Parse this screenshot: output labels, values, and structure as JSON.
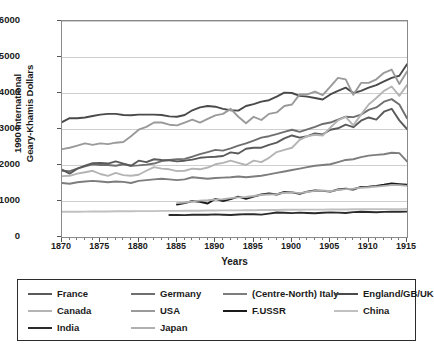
{
  "chart_data": {
    "type": "line",
    "title": "",
    "xlabel": "Years",
    "ylabel_line1": "1990 International",
    "ylabel_line2": "Geary-Khamis Dollars",
    "xlim": [
      1870,
      1915
    ],
    "ylim": [
      0,
      6000
    ],
    "xticks": [
      1870,
      1875,
      1880,
      1885,
      1890,
      1895,
      1900,
      1905,
      1910,
      1915
    ],
    "yticks": [
      0,
      1000,
      2000,
      3000,
      4000,
      5000,
      6000
    ],
    "grid": "horizontal",
    "legend_position": "below-plot",
    "x": [
      1870,
      1871,
      1872,
      1873,
      1874,
      1875,
      1876,
      1877,
      1878,
      1879,
      1880,
      1881,
      1882,
      1883,
      1884,
      1885,
      1886,
      1887,
      1888,
      1889,
      1890,
      1891,
      1892,
      1893,
      1894,
      1895,
      1896,
      1897,
      1898,
      1899,
      1900,
      1901,
      1902,
      1903,
      1904,
      1905,
      1906,
      1907,
      1908,
      1909,
      1910,
      1911,
      1912,
      1913,
      1914,
      1915
    ],
    "series": [
      {
        "name": "England/GB/UK",
        "color": "#4a4a4a",
        "width": 1.9,
        "start_year": 1870,
        "values": [
          3190,
          3300,
          3300,
          3320,
          3360,
          3400,
          3420,
          3420,
          3390,
          3380,
          3400,
          3400,
          3400,
          3390,
          3350,
          3340,
          3390,
          3520,
          3600,
          3640,
          3620,
          3560,
          3520,
          3510,
          3640,
          3690,
          3760,
          3800,
          3900,
          4010,
          4000,
          3920,
          3900,
          3860,
          3820,
          3960,
          4060,
          4150,
          4000,
          4060,
          4150,
          4220,
          4320,
          4420,
          4480,
          4800
        ]
      },
      {
        "name": "USA",
        "color": "#9a9a9a",
        "width": 1.9,
        "start_year": 1870,
        "values": [
          2440,
          2480,
          2540,
          2600,
          2560,
          2600,
          2580,
          2620,
          2640,
          2800,
          2980,
          3060,
          3180,
          3180,
          3120,
          3100,
          3180,
          3260,
          3180,
          3280,
          3380,
          3420,
          3560,
          3340,
          3160,
          3340,
          3250,
          3420,
          3460,
          3640,
          3680,
          3960,
          3960,
          4040,
          3940,
          4180,
          4420,
          4380,
          3950,
          4280,
          4280,
          4380,
          4560,
          4650,
          4250,
          4600
        ]
      },
      {
        "name": "Germany",
        "color": "#6f6f6f",
        "width": 1.9,
        "start_year": 1870,
        "values": [
          1840,
          1830,
          1900,
          1960,
          2020,
          2000,
          2000,
          1980,
          2020,
          1980,
          1990,
          2010,
          2040,
          2110,
          2140,
          2160,
          2170,
          2230,
          2300,
          2360,
          2420,
          2400,
          2460,
          2540,
          2600,
          2680,
          2760,
          2800,
          2860,
          2920,
          2980,
          2920,
          2990,
          3060,
          3140,
          3180,
          3260,
          3340,
          3330,
          3400,
          3530,
          3600,
          3760,
          3830,
          3680,
          3300
        ]
      },
      {
        "name": "France",
        "color": "#5a5a5a",
        "width": 1.9,
        "start_year": 1870,
        "values": [
          1870,
          1760,
          1900,
          1980,
          2050,
          2060,
          2040,
          2100,
          2040,
          1980,
          2120,
          2080,
          2160,
          2140,
          2130,
          2100,
          2120,
          2150,
          2200,
          2220,
          2230,
          2250,
          2350,
          2320,
          2450,
          2480,
          2480,
          2560,
          2620,
          2740,
          2820,
          2760,
          2800,
          2880,
          2850,
          2980,
          3020,
          3120,
          3050,
          3230,
          3320,
          3260,
          3480,
          3560,
          3240,
          3000
        ]
      },
      {
        "name": "Canada",
        "color": "#b4b4b4",
        "width": 1.9,
        "start_year": 1870,
        "values": [
          1690,
          1700,
          1760,
          1800,
          1840,
          1750,
          1700,
          1780,
          1720,
          1700,
          1730,
          1840,
          1940,
          1900,
          1880,
          1830,
          1840,
          1900,
          1880,
          1930,
          2020,
          2060,
          2120,
          2060,
          2000,
          2120,
          2080,
          2200,
          2360,
          2420,
          2480,
          2700,
          2800,
          2840,
          2820,
          3040,
          3240,
          3340,
          3100,
          3400,
          3680,
          3860,
          4060,
          4180,
          3920,
          4220
        ]
      },
      {
        "name": "(Centre-North) Italy",
        "color": "#7d7d7d",
        "width": 1.9,
        "start_year": 1870,
        "values": [
          1500,
          1480,
          1520,
          1540,
          1560,
          1540,
          1520,
          1540,
          1530,
          1500,
          1560,
          1580,
          1600,
          1620,
          1600,
          1580,
          1600,
          1660,
          1640,
          1620,
          1640,
          1650,
          1660,
          1680,
          1660,
          1680,
          1700,
          1740,
          1780,
          1820,
          1860,
          1900,
          1940,
          1980,
          2000,
          2020,
          2080,
          2140,
          2160,
          2220,
          2260,
          2280,
          2300,
          2340,
          2330,
          2100
        ]
      },
      {
        "name": "F.USSR",
        "color": "#1a1a1a",
        "width": 1.9,
        "start_year": 1885,
        "values": [
          null,
          null,
          null,
          null,
          null,
          null,
          null,
          null,
          null,
          null,
          null,
          null,
          null,
          null,
          null,
          900,
          940,
          1000,
          980,
          930,
          1060,
          1000,
          1050,
          1120,
          1060,
          1120,
          1180,
          1210,
          1180,
          1250,
          1240,
          1200,
          1260,
          1290,
          1280,
          1260,
          1320,
          1340,
          1320,
          1390,
          1400,
          1420,
          1450,
          1490,
          1470,
          1450
        ]
      },
      {
        "name": "Japan",
        "color": "#b0b0b0",
        "width": 1.9,
        "start_year": 1885,
        "values": [
          null,
          null,
          null,
          null,
          null,
          null,
          null,
          null,
          null,
          null,
          null,
          null,
          null,
          null,
          null,
          940,
          960,
          990,
          1010,
          1020,
          1040,
          1050,
          1080,
          1100,
          1110,
          1140,
          1170,
          1180,
          1190,
          1230,
          1240,
          1220,
          1250,
          1280,
          1290,
          1270,
          1310,
          1330,
          1340,
          1370,
          1380,
          1400,
          1420,
          1440,
          1440,
          1420
        ]
      },
      {
        "name": "China",
        "color": "#c0c0c0",
        "width": 1.9,
        "start_year": 1870,
        "values": [
          700,
          700,
          700,
          705,
          710,
          710,
          710,
          715,
          715,
          715,
          720,
          720,
          720,
          725,
          725,
          725,
          730,
          730,
          730,
          735,
          735,
          740,
          740,
          740,
          745,
          745,
          750,
          750,
          750,
          755,
          755,
          755,
          760,
          760,
          760,
          765,
          765,
          765,
          770,
          770,
          770,
          775,
          775,
          775,
          775,
          780
        ]
      },
      {
        "name": "India",
        "color": "#2b2b2b",
        "width": 1.9,
        "start_year": 1884,
        "values": [
          null,
          null,
          null,
          null,
          null,
          null,
          null,
          null,
          null,
          null,
          null,
          null,
          null,
          null,
          610,
          612,
          608,
          618,
          622,
          620,
          628,
          620,
          612,
          624,
          636,
          630,
          622,
          650,
          680,
          672,
          664,
          676,
          668,
          660,
          672,
          684,
          676,
          668,
          690,
          700,
          694,
          686,
          698,
          706,
          700,
          706
        ]
      }
    ]
  },
  "legend": {
    "rows": [
      [
        {
          "label": "France",
          "color": "#5a5a5a"
        },
        {
          "label": "Germany",
          "color": "#6f6f6f"
        },
        {
          "label": "(Centre-North) Italy",
          "color": "#7d7d7d"
        },
        {
          "label": "England/GB/UK",
          "color": "#4a4a4a"
        }
      ],
      [
        {
          "label": "Canada",
          "color": "#b4b4b4"
        },
        {
          "label": "USA",
          "color": "#9a9a9a"
        },
        {
          "label": "F.USSR",
          "color": "#1a1a1a"
        },
        {
          "label": "China",
          "color": "#c0c0c0"
        }
      ],
      [
        {
          "label": "India",
          "color": "#2b2b2b"
        },
        {
          "label": "Japan",
          "color": "#b0b0b0"
        }
      ]
    ]
  }
}
